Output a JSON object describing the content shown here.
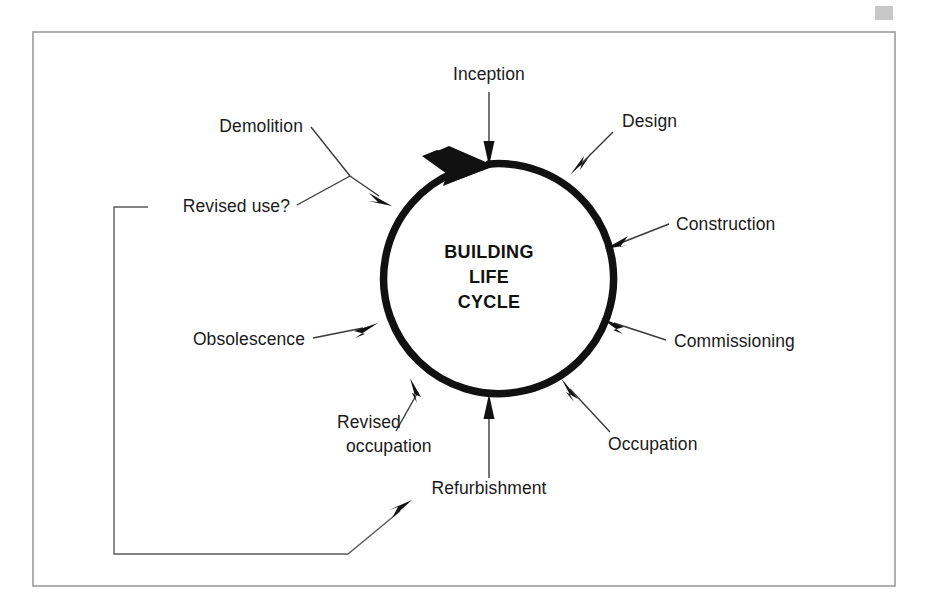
{
  "figure": {
    "kind": "cycle-diagram",
    "center_title_lines": [
      "BUILDING",
      "LIFE",
      "CYCLE"
    ],
    "center_title_text": "BUILDING LIFE CYCLE",
    "frame": {
      "present": true,
      "color": "#9a9a9a"
    },
    "ring": {
      "color": "#111111",
      "direction": "clockwise",
      "arrow_at": "top"
    },
    "corner_mark": {
      "present": true,
      "color": "#c8c8c8"
    }
  },
  "labels": {
    "inception": "Inception",
    "design": "Design",
    "construction": "Construction",
    "commissioning": "Commissioning",
    "occupation": "Occupation",
    "refurbishment": "Refurbishment",
    "revised_occupation_line1": "Revised",
    "revised_occupation_line2": "occupation",
    "revised_occupation_text": "Revised occupation",
    "obsolescence": "Obsolescence",
    "revised_use": "Revised use?",
    "demolition": "Demolition"
  },
  "stages": [
    {
      "id": "inception",
      "label": "Inception",
      "clock_position": "12:00",
      "points_to_ring": true
    },
    {
      "id": "design",
      "label": "Design",
      "clock_position": "1:00",
      "points_to_ring": true
    },
    {
      "id": "construction",
      "label": "Construction",
      "clock_position": "2:00",
      "points_to_ring": true
    },
    {
      "id": "commissioning",
      "label": "Commissioning",
      "clock_position": "3:30",
      "points_to_ring": true
    },
    {
      "id": "occupation",
      "label": "Occupation",
      "clock_position": "4:30",
      "points_to_ring": true
    },
    {
      "id": "refurbishment",
      "label": "Refurbishment",
      "clock_position": "6:00",
      "points_to_ring": true
    },
    {
      "id": "revised-occupation",
      "label": "Revised occupation",
      "clock_position": "7:30",
      "points_to_ring": true
    },
    {
      "id": "obsolescence",
      "label": "Obsolescence",
      "clock_position": "9:00",
      "points_to_ring": true
    },
    {
      "id": "revised-use",
      "label": "Revised use?",
      "clock_position": "10:30",
      "points_to_ring": true
    },
    {
      "id": "demolition",
      "label": "Demolition",
      "clock_position": "10:30",
      "points_to_ring": true
    }
  ],
  "feedback_loop": {
    "from": "Revised use?",
    "to": "Refurbishment",
    "style": "orthogonal-with-diagonal-arrow"
  },
  "colors": {
    "ring": "#111111",
    "text": "#1a1a1a",
    "leader": "#3a3a3a",
    "frame": "#9a9a9a",
    "background": "#ffffff"
  }
}
